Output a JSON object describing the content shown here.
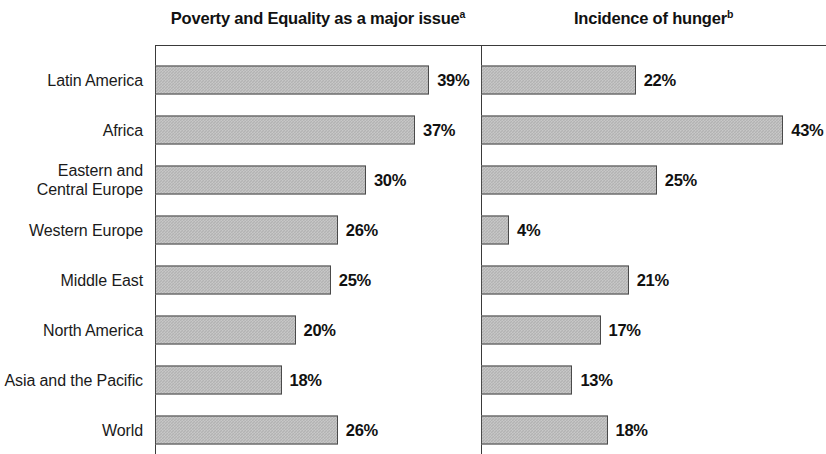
{
  "chart_data": {
    "type": "bar",
    "title": "",
    "orientation": "horizontal",
    "grid": false,
    "legend": null,
    "categories": [
      "Latin America",
      "Africa",
      "Eastern and Central Europe",
      "Western Europe",
      "Middle East",
      "North America",
      "Asia and the Pacific",
      "World"
    ],
    "panels": [
      {
        "title": "Poverty and Equality as a major issue",
        "footnote_marker": "a",
        "xlabel": "",
        "ylabel": "",
        "unit": "%",
        "xlim": [
          0,
          46
        ],
        "values": [
          39,
          37,
          30,
          26,
          25,
          20,
          18,
          26
        ],
        "labels": [
          "39%",
          "37%",
          "30%",
          "26%",
          "25%",
          "20%",
          "18%",
          "26%"
        ]
      },
      {
        "title": "Incidence of hunger",
        "footnote_marker": "b",
        "xlabel": "",
        "ylabel": "",
        "unit": "%",
        "xlim": [
          0,
          46
        ],
        "values": [
          22,
          43,
          25,
          4,
          21,
          17,
          13,
          18
        ],
        "labels": [
          "22%",
          "43%",
          "25%",
          "4%",
          "21%",
          "17%",
          "13%",
          "18%"
        ]
      }
    ],
    "series": [
      {
        "name": "Poverty and Equality as a major issue",
        "values": [
          39,
          37,
          30,
          26,
          25,
          20,
          18,
          26
        ]
      },
      {
        "name": "Incidence of hunger",
        "values": [
          22,
          43,
          25,
          4,
          21,
          17,
          13,
          18
        ]
      }
    ]
  },
  "rows": [
    {
      "label_line1": "Latin America",
      "label_line2": ""
    },
    {
      "label_line1": "Africa",
      "label_line2": ""
    },
    {
      "label_line1": "Eastern and",
      "label_line2": "Central Europe"
    },
    {
      "label_line1": "Western Europe",
      "label_line2": ""
    },
    {
      "label_line1": "Middle East",
      "label_line2": ""
    },
    {
      "label_line1": "North America",
      "label_line2": ""
    },
    {
      "label_line1": "Asia and the Pacific",
      "label_line2": ""
    },
    {
      "label_line1": "World",
      "label_line2": ""
    }
  ],
  "style": {
    "bar_fill": "#b3b3b3",
    "bar_border": "#4a4a4a",
    "axis_color": "#3a3a3a",
    "text_color": "#1a1a1a",
    "background": "#ffffff"
  }
}
